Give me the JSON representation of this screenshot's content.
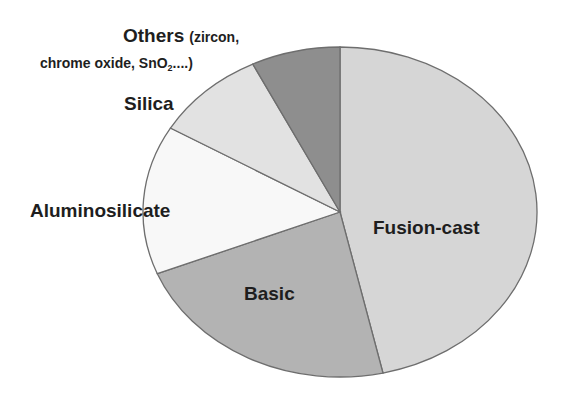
{
  "chart_data": {
    "type": "pie",
    "title": "",
    "start": "top",
    "direction": "clockwise",
    "slices": [
      {
        "label": "Fusion-cast",
        "value": 46.5,
        "color": "#d6d6d6"
      },
      {
        "label": "Basic",
        "value": 22.4,
        "color": "#b3b3b3"
      },
      {
        "label": "Aluminosilicate",
        "value": 14.6,
        "color": "#f8f8f8"
      },
      {
        "label": "Silica",
        "value": 9.2,
        "color": "#e2e2e2"
      },
      {
        "label": "Others (zircon, chrome oxide, SnO2....)",
        "value": 7.3,
        "color": "#8e8e8e"
      }
    ],
    "labels": {
      "fusion": "Fusion-cast",
      "basic": "Basic",
      "alumino": "Aluminosilicate",
      "silica": "Silica",
      "others_line1_main": "Others",
      "others_line1_small": "(zircon,",
      "others_line2": "chrome oxide, SnO",
      "others_sub": "2",
      "others_end": "....)"
    },
    "legend": "none (labels placed on/near slices)"
  }
}
